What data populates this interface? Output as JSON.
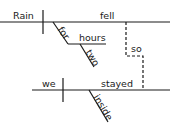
{
  "diagram": {
    "type": "sentence-diagram",
    "clause1": {
      "subject": "Rain",
      "verb": "fell",
      "modifiers": {
        "preposition": "for",
        "object": "hours",
        "object_modifier": "two"
      }
    },
    "conjunction": "so",
    "clause2": {
      "subject": "we",
      "verb": "stayed",
      "modifier": "inside"
    },
    "line_color": "#1a1a1a"
  }
}
